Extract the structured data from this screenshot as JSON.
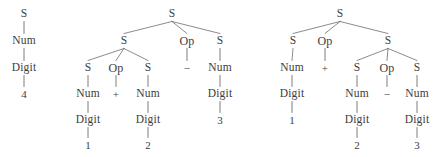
{
  "figure": {
    "caption": "",
    "symbols": {
      "start": "S",
      "num": "Num",
      "digit": "Digit",
      "op": "Op",
      "plus": "+",
      "minus": "−"
    },
    "stroke_color": "#6d6d6d",
    "text_color": "#3c3c3c",
    "background": "#ffffff"
  },
  "trees": [
    {
      "id": "tree-1",
      "name": "parse-tree-4",
      "expression": "4",
      "nodes": [
        {
          "id": "t1n1",
          "label": "S",
          "x": 24,
          "y": 14,
          "kind": "nonterminal"
        },
        {
          "id": "t1n2",
          "label": "Num",
          "x": 24,
          "y": 41,
          "kind": "nonterminal"
        },
        {
          "id": "t1n3",
          "label": "Digit",
          "x": 24,
          "y": 68,
          "kind": "nonterminal"
        },
        {
          "id": "t1n4",
          "label": "4",
          "x": 24,
          "y": 94,
          "kind": "terminal"
        }
      ],
      "edges": [
        {
          "from": "t1n1",
          "to": "t1n2"
        },
        {
          "from": "t1n2",
          "to": "t1n3"
        },
        {
          "from": "t1n3",
          "to": "t1n4"
        }
      ]
    },
    {
      "id": "tree-2",
      "name": "parse-tree-left-assoc",
      "expression": "1 + 2 − 3",
      "nodes": [
        {
          "id": "t2n1",
          "label": "S",
          "x": 172,
          "y": 14,
          "kind": "nonterminal"
        },
        {
          "id": "t2n2",
          "label": "S",
          "x": 124,
          "y": 41,
          "kind": "nonterminal"
        },
        {
          "id": "t2n3",
          "label": "Op",
          "x": 187,
          "y": 41,
          "kind": "nonterminal"
        },
        {
          "id": "t2n4",
          "label": "S",
          "x": 220,
          "y": 41,
          "kind": "nonterminal"
        },
        {
          "id": "t2n5",
          "label": "S",
          "x": 88,
          "y": 68,
          "kind": "nonterminal"
        },
        {
          "id": "t2n6",
          "label": "Op",
          "x": 116,
          "y": 68,
          "kind": "nonterminal"
        },
        {
          "id": "t2n7",
          "label": "S",
          "x": 148,
          "y": 68,
          "kind": "nonterminal"
        },
        {
          "id": "t2n8",
          "label": "−",
          "x": 187,
          "y": 68,
          "kind": "terminal"
        },
        {
          "id": "t2n9",
          "label": "Num",
          "x": 220,
          "y": 68,
          "kind": "nonterminal"
        },
        {
          "id": "t2n10",
          "label": "Num",
          "x": 88,
          "y": 94,
          "kind": "nonterminal"
        },
        {
          "id": "t2n11",
          "label": "+",
          "x": 116,
          "y": 94,
          "kind": "terminal"
        },
        {
          "id": "t2n12",
          "label": "Num",
          "x": 148,
          "y": 94,
          "kind": "nonterminal"
        },
        {
          "id": "t2n13",
          "label": "Digit",
          "x": 220,
          "y": 94,
          "kind": "nonterminal"
        },
        {
          "id": "t2n14",
          "label": "Digit",
          "x": 88,
          "y": 120,
          "kind": "nonterminal"
        },
        {
          "id": "t2n15",
          "label": "Digit",
          "x": 148,
          "y": 120,
          "kind": "nonterminal"
        },
        {
          "id": "t2n16",
          "label": "3",
          "x": 220,
          "y": 120,
          "kind": "terminal"
        },
        {
          "id": "t2n17",
          "label": "1",
          "x": 88,
          "y": 145,
          "kind": "terminal"
        },
        {
          "id": "t2n18",
          "label": "2",
          "x": 148,
          "y": 145,
          "kind": "terminal"
        }
      ],
      "edges": [
        {
          "from": "t2n1",
          "to": "t2n2"
        },
        {
          "from": "t2n1",
          "to": "t2n3"
        },
        {
          "from": "t2n1",
          "to": "t2n4"
        },
        {
          "from": "t2n2",
          "to": "t2n5"
        },
        {
          "from": "t2n2",
          "to": "t2n6"
        },
        {
          "from": "t2n2",
          "to": "t2n7"
        },
        {
          "from": "t2n3",
          "to": "t2n8"
        },
        {
          "from": "t2n4",
          "to": "t2n9"
        },
        {
          "from": "t2n5",
          "to": "t2n10"
        },
        {
          "from": "t2n6",
          "to": "t2n11"
        },
        {
          "from": "t2n7",
          "to": "t2n12"
        },
        {
          "from": "t2n9",
          "to": "t2n13"
        },
        {
          "from": "t2n10",
          "to": "t2n14"
        },
        {
          "from": "t2n12",
          "to": "t2n15"
        },
        {
          "from": "t2n13",
          "to": "t2n16"
        },
        {
          "from": "t2n14",
          "to": "t2n17"
        },
        {
          "from": "t2n15",
          "to": "t2n18"
        }
      ]
    },
    {
      "id": "tree-3",
      "name": "parse-tree-right-assoc",
      "expression": "1 + 2 − 3",
      "nodes": [
        {
          "id": "t3n1",
          "label": "S",
          "x": 340,
          "y": 14,
          "kind": "nonterminal"
        },
        {
          "id": "t3n2",
          "label": "S",
          "x": 293,
          "y": 41,
          "kind": "nonterminal"
        },
        {
          "id": "t3n3",
          "label": "Op",
          "x": 325,
          "y": 41,
          "kind": "nonterminal"
        },
        {
          "id": "t3n4",
          "label": "S",
          "x": 388,
          "y": 41,
          "kind": "nonterminal"
        },
        {
          "id": "t3n5",
          "label": "Num",
          "x": 292,
          "y": 68,
          "kind": "nonterminal"
        },
        {
          "id": "t3n6",
          "label": "+",
          "x": 325,
          "y": 68,
          "kind": "terminal"
        },
        {
          "id": "t3n7",
          "label": "S",
          "x": 357,
          "y": 68,
          "kind": "nonterminal"
        },
        {
          "id": "t3n8",
          "label": "Op",
          "x": 387,
          "y": 68,
          "kind": "nonterminal"
        },
        {
          "id": "t3n9",
          "label": "S",
          "x": 417,
          "y": 68,
          "kind": "nonterminal"
        },
        {
          "id": "t3n10",
          "label": "Digit",
          "x": 292,
          "y": 94,
          "kind": "nonterminal"
        },
        {
          "id": "t3n11",
          "label": "Num",
          "x": 357,
          "y": 94,
          "kind": "nonterminal"
        },
        {
          "id": "t3n12",
          "label": "−",
          "x": 387,
          "y": 94,
          "kind": "terminal"
        },
        {
          "id": "t3n13",
          "label": "Num",
          "x": 417,
          "y": 94,
          "kind": "nonterminal"
        },
        {
          "id": "t3n14",
          "label": "1",
          "x": 292,
          "y": 120,
          "kind": "terminal"
        },
        {
          "id": "t3n15",
          "label": "Digit",
          "x": 357,
          "y": 120,
          "kind": "nonterminal"
        },
        {
          "id": "t3n16",
          "label": "Digit",
          "x": 417,
          "y": 120,
          "kind": "nonterminal"
        },
        {
          "id": "t3n17",
          "label": "2",
          "x": 357,
          "y": 145,
          "kind": "terminal"
        },
        {
          "id": "t3n18",
          "label": "3",
          "x": 417,
          "y": 145,
          "kind": "terminal"
        }
      ],
      "edges": [
        {
          "from": "t3n1",
          "to": "t3n2"
        },
        {
          "from": "t3n1",
          "to": "t3n3"
        },
        {
          "from": "t3n1",
          "to": "t3n4"
        },
        {
          "from": "t3n2",
          "to": "t3n5"
        },
        {
          "from": "t3n3",
          "to": "t3n6"
        },
        {
          "from": "t3n4",
          "to": "t3n7"
        },
        {
          "from": "t3n4",
          "to": "t3n8"
        },
        {
          "from": "t3n4",
          "to": "t3n9"
        },
        {
          "from": "t3n5",
          "to": "t3n10"
        },
        {
          "from": "t3n7",
          "to": "t3n11"
        },
        {
          "from": "t3n8",
          "to": "t3n12"
        },
        {
          "from": "t3n9",
          "to": "t3n13"
        },
        {
          "from": "t3n10",
          "to": "t3n14"
        },
        {
          "from": "t3n11",
          "to": "t3n15"
        },
        {
          "from": "t3n13",
          "to": "t3n16"
        },
        {
          "from": "t3n15",
          "to": "t3n17"
        },
        {
          "from": "t3n16",
          "to": "t3n18"
        }
      ]
    }
  ]
}
